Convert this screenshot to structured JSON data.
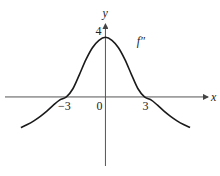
{
  "chart_data": {
    "type": "line",
    "title": "",
    "xlabel": "x",
    "ylabel": "y",
    "xlim": [
      -8.1,
      8.8
    ],
    "ylim": [
      -5.3,
      6.5
    ],
    "grid": false,
    "x_ticks": [
      {
        "value": -3,
        "label": "−3"
      },
      {
        "value": 0,
        "label": "0"
      },
      {
        "value": 3,
        "label": "3"
      }
    ],
    "y_ticks": [
      {
        "value": 4,
        "label": "4"
      }
    ],
    "series": [
      {
        "name": "f''",
        "label": "f″",
        "x": [
          -6.5,
          -6.0,
          -5.5,
          -5.0,
          -4.5,
          -4.0,
          -3.5,
          -3.0,
          -2.5,
          -2.0,
          -1.5,
          -1.0,
          -0.5,
          0.0,
          0.5,
          1.0,
          1.5,
          2.0,
          2.5,
          3.0,
          3.5,
          4.0,
          4.5,
          5.0,
          5.5,
          6.0,
          6.5
        ],
        "y": [
          -2.05,
          -1.85,
          -1.6,
          -1.3,
          -0.95,
          -0.55,
          -0.2,
          0.0,
          0.55,
          1.5,
          2.5,
          3.3,
          3.8,
          4.0,
          3.8,
          3.3,
          2.5,
          1.5,
          0.55,
          0.0,
          -0.2,
          -0.55,
          -0.95,
          -1.3,
          -1.6,
          -1.85,
          -2.05
        ]
      }
    ]
  }
}
